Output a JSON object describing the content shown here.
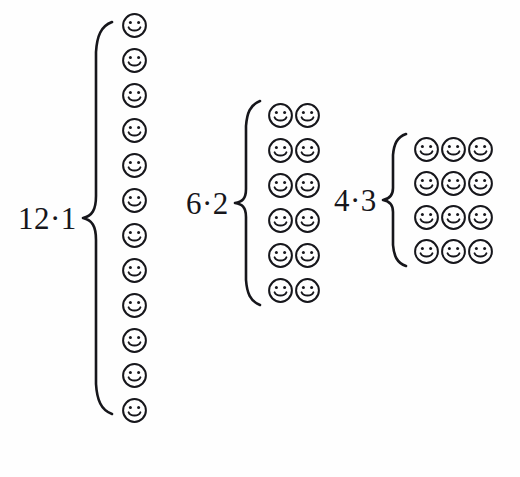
{
  "figure": {
    "background_color": "#fefefe",
    "ink_color": "#16161b",
    "groups": [
      {
        "id": "group-12-1",
        "label": "12·1",
        "factor_a": 12,
        "factor_b": 1,
        "rows": 12,
        "cols": 1,
        "total": 12,
        "brace": "left-curly-brace",
        "icon": "smiley-face-icon"
      },
      {
        "id": "group-6-2",
        "label": "6·2",
        "factor_a": 6,
        "factor_b": 2,
        "rows": 6,
        "cols": 2,
        "total": 12,
        "brace": "left-curly-brace",
        "icon": "smiley-face-icon"
      },
      {
        "id": "group-4-3",
        "label": "4·3",
        "factor_a": 4,
        "factor_b": 3,
        "rows": 4,
        "cols": 3,
        "total": 12,
        "brace": "left-curly-brace",
        "icon": "smiley-face-icon"
      }
    ]
  }
}
